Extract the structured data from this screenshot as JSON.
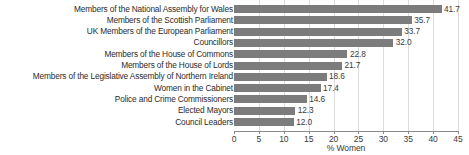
{
  "chart_data": {
    "type": "bar",
    "orientation": "horizontal",
    "title": "",
    "subtitle": "",
    "xlabel": "% Women",
    "ylabel": "",
    "xlim": [
      0,
      45
    ],
    "xticks": [
      0,
      5,
      10,
      15,
      20,
      25,
      30,
      35,
      40,
      45
    ],
    "xtick_labels": [
      "0",
      "5",
      "10",
      "15",
      "20",
      "25",
      "30",
      "35",
      "40",
      "45"
    ],
    "grid": "vertical",
    "legend": "none",
    "bar_color": "#7c7c7c",
    "categories": [
      "Members of the National Assembly for Wales",
      "Members of the Scottish Parliament",
      "UK Members of the European Parliament",
      "Councillors",
      "Members of the House of Commons",
      "Members of the House of Lords",
      "Members of the Legislative Assembly of Northern Ireland",
      "Women in the Cabinet",
      "Police and Crime Commissioners",
      "Elected Mayors",
      "Council Leaders"
    ],
    "values": [
      41.7,
      35.7,
      33.7,
      32.0,
      22.8,
      21.7,
      18.6,
      17.4,
      14.6,
      12.3,
      12.0
    ],
    "value_labels": [
      "41.7",
      "35.7",
      "33.7",
      "32.0",
      "22.8",
      "21.7",
      "18.6",
      "17.4",
      "14.6",
      "12.3",
      "12.0"
    ]
  }
}
